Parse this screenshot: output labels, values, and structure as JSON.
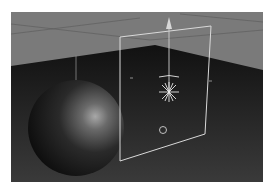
{
  "viewport": {
    "name": "3D Viewport",
    "background_color": "#7a7a7a",
    "floor_color": "#1c1c1c",
    "grid_color": "#8c8c8c",
    "frame_color": "#d9d9d9"
  },
  "scene": {
    "objects": [
      {
        "type": "sphere",
        "label": "Sphere"
      },
      {
        "type": "area-light-plane",
        "label": "Light plane"
      },
      {
        "type": "omni-light",
        "label": "Light"
      },
      {
        "type": "target-circle",
        "label": "Target"
      }
    ],
    "gizmo": {
      "axis": "Y",
      "icon": "move-arrow-up-icon"
    }
  }
}
